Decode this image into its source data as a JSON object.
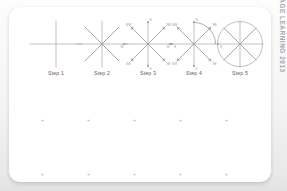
{
  "figure": {
    "background_color": "#f2f2f2",
    "card_color": "#ffffff",
    "ink_color": "#9a9aa0",
    "copyright": "© CENGAGE LEARNING 2013",
    "steps": [
      {
        "id": "step-1",
        "label": "Step 1",
        "description": "Two perpendicular lines forming a cross",
        "spokes": 4,
        "has_diagonals": false,
        "has_arrowheads": false,
        "has_arc": false,
        "has_circle": false,
        "labels": []
      },
      {
        "id": "step-2",
        "label": "Step 2",
        "description": "Cross plus diagonals forming an eight-spoke star",
        "spokes": 8,
        "has_diagonals": true,
        "has_arrowheads": false,
        "has_arc": false,
        "has_circle": false,
        "labels": []
      },
      {
        "id": "step-3",
        "label": "Step 3",
        "description": "Eight-spoke star with arrowheads and direction labels",
        "spokes": 8,
        "has_diagonals": true,
        "has_arrowheads": true,
        "has_arc": false,
        "has_circle": false,
        "labels": [
          "N",
          "NE",
          "E",
          "SE",
          "S",
          "SW",
          "W",
          "NW"
        ]
      },
      {
        "id": "step-4",
        "label": "Step 4",
        "description": "Eight-spoke star with arrowheads and an angle arc in the upper right quadrant",
        "spokes": 8,
        "has_diagonals": true,
        "has_arrowheads": true,
        "has_arc": true,
        "has_circle": false,
        "labels": [
          "N",
          "NE",
          "E",
          "SE",
          "S",
          "SW",
          "W",
          "NW"
        ]
      },
      {
        "id": "step-5",
        "label": "Step 5",
        "description": "Eight-spoke star enclosed in a circle",
        "spokes": 8,
        "has_diagonals": true,
        "has_arrowheads": false,
        "has_arc": false,
        "has_circle": true,
        "labels": []
      }
    ],
    "tick_rows": [
      {
        "id": "tick-row-upper",
        "top": 118,
        "count": 5
      },
      {
        "id": "tick-row-lower",
        "top": 172,
        "count": 5
      }
    ]
  }
}
